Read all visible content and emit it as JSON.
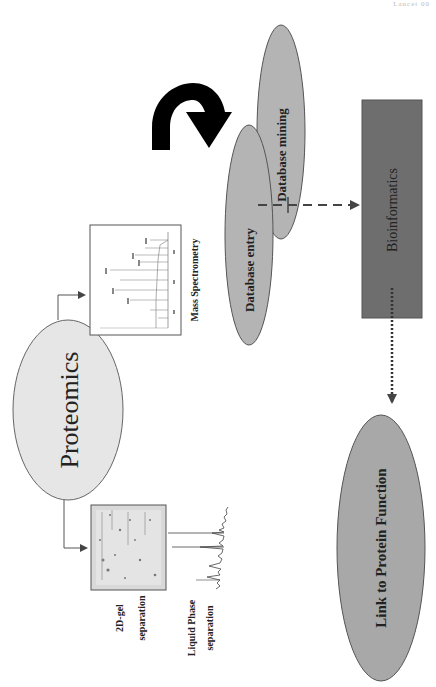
{
  "header": {
    "corner_text": "Lancet 00"
  },
  "nodes": {
    "proteomics": {
      "label": "Proteomics",
      "fill": "#e6e6e6"
    },
    "mass_spec": {
      "label": "Mass Spectrometry"
    },
    "gel": {
      "label_line1": "2D-gel",
      "label_line2": "separation"
    },
    "liquid": {
      "label_line1": "Liquid Phase",
      "label_line2": "separation"
    },
    "db_entry": {
      "label": "Database entry",
      "fill": "#b4b4b4"
    },
    "db_mining": {
      "label": "Database mining",
      "fill": "#b4b4b4"
    },
    "bioinformatics": {
      "label": "Bioinformatics",
      "fill": "#6e6e6e"
    },
    "link_function": {
      "label": "Link to Protein Function",
      "fill": "#a8a8a8"
    }
  },
  "icons": {
    "cycle_arrow": "curved-arrow-icon",
    "connector_arrows": [
      "arrow-proteomics-to-ms",
      "arrow-proteomics-to-gel",
      "dashed-arrow-db-to-bioinformatics",
      "dotted-arrow-bioinformatics-to-function"
    ]
  },
  "colors": {
    "stroke": "#555555",
    "arrow": "#444444",
    "text": "#222222"
  }
}
